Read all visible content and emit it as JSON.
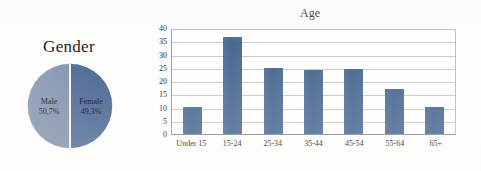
{
  "gender": {
    "title": "Gender",
    "slices": [
      {
        "label": "Male",
        "percent_text": "50,7%",
        "value": 50.7,
        "color": "#8a9cb5"
      },
      {
        "label": "Female",
        "percent_text": "49,3%",
        "value": 49.3,
        "color": "#4f6c98"
      }
    ]
  },
  "age": {
    "title": "Age"
  },
  "chart_data": [
    {
      "type": "pie",
      "title": "Gender",
      "categories": [
        "Male",
        "Female"
      ],
      "values": [
        50.7,
        49.3
      ],
      "value_labels": [
        "50,7%",
        "49,3%"
      ],
      "colors": [
        "#8a9cb5",
        "#4f6c98"
      ],
      "legend": "none",
      "annotations": [
        "Male 50,7%",
        "Female 49,3%"
      ]
    },
    {
      "type": "bar",
      "title": "Age",
      "categories": [
        "Under 15",
        "15-24",
        "25-34",
        "35-44",
        "45-54",
        "55-64",
        "65+"
      ],
      "values": [
        10,
        36.5,
        25,
        24,
        24.5,
        17,
        10
      ],
      "series": [
        {
          "name": "Age",
          "values": [
            10,
            36.5,
            25,
            24,
            24.5,
            17,
            10
          ]
        }
      ],
      "xlabel": "",
      "ylabel": "",
      "ylim": [
        0,
        40
      ],
      "yticks": [
        0,
        5,
        10,
        15,
        20,
        25,
        30,
        35,
        40
      ],
      "ytick_labels": [
        "0",
        "5",
        "10",
        "15",
        "20",
        "25",
        "30",
        "35",
        "40"
      ],
      "grid": true,
      "grid_axis": "y",
      "legend": "none",
      "bar_color": "#4a6a96"
    }
  ]
}
